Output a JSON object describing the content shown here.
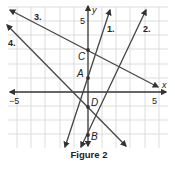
{
  "figure": {
    "caption": "Figure 2",
    "axes": {
      "x_label": "x",
      "y_label": "y",
      "x_tick_neg": "−5",
      "x_tick_pos": "5",
      "y_tick_pos": "5",
      "range": [
        -5,
        5
      ]
    },
    "points": [
      {
        "label": "C",
        "x": 0,
        "y": 3
      },
      {
        "label": "A",
        "x": 0,
        "y": 1
      },
      {
        "label": "D",
        "x": 0,
        "y": -1
      },
      {
        "label": "B",
        "x": 0,
        "y": -3
      }
    ],
    "lines": [
      {
        "label": "1.",
        "through": "A"
      },
      {
        "label": "2.",
        "through": "B"
      },
      {
        "label": "3.",
        "through": "C"
      },
      {
        "label": "4.",
        "through": "D"
      }
    ],
    "colors": {
      "line": "#444444",
      "grid": "#d0d0d0",
      "axis": "#333333"
    }
  }
}
